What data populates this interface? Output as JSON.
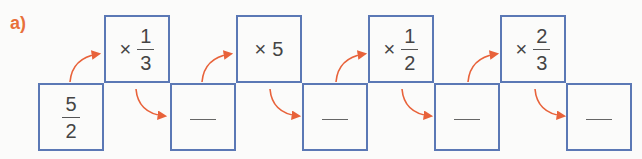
{
  "label": "a)",
  "colors": {
    "box_border": "#5b78b5",
    "arrow": "#e8623a",
    "label": "#e8703a"
  },
  "start": {
    "numerator": "5",
    "denominator": "2"
  },
  "operations": [
    {
      "op": "×",
      "numerator": "1",
      "denominator": "3"
    },
    {
      "op": "×",
      "value": "5"
    },
    {
      "op": "×",
      "numerator": "1",
      "denominator": "2"
    },
    {
      "op": "×",
      "numerator": "2",
      "denominator": "3"
    }
  ],
  "results": [
    "",
    "",
    "",
    ""
  ]
}
